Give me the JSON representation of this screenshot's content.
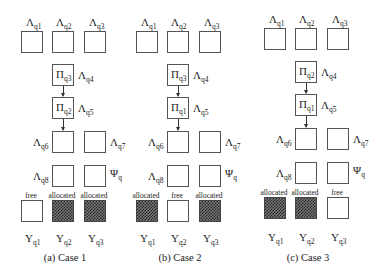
{
  "figure": {
    "cases": [
      {
        "id": "case1",
        "caption": "(a) Case 1",
        "top_labels": [
          {
            "base": "Λ",
            "sub": "q1"
          },
          {
            "base": "Λ",
            "sub": "q2"
          },
          {
            "base": "Λ",
            "sub": "q3"
          }
        ],
        "pi_boxes": [
          {
            "pi": {
              "base": "Π",
              "sub": "q3"
            },
            "lambda": {
              "base": "Λ",
              "sub": "q4"
            }
          },
          {
            "pi": {
              "base": "Π",
              "sub": "q2"
            },
            "lambda": {
              "base": "Λ",
              "sub": "q5"
            }
          }
        ],
        "row6": {
          "left": {
            "base": "Λ",
            "sub": "q6"
          },
          "right": {
            "base": "Λ",
            "sub": "q7"
          }
        },
        "row8": {
          "left": {
            "base": "Λ",
            "sub": "q8"
          },
          "right": {
            "base": "Ψ",
            "sub": "q"
          }
        },
        "slots": [
          {
            "status": "free",
            "label": {
              "base": "Y",
              "sub": "q1"
            }
          },
          {
            "status": "allocated",
            "label": {
              "base": "Y",
              "sub": "q2"
            }
          },
          {
            "status": "allocated",
            "label": {
              "base": "Y",
              "sub": "q3"
            }
          }
        ]
      },
      {
        "id": "case2",
        "caption": "(b) Case 2",
        "top_labels": [
          {
            "base": "Λ",
            "sub": "q1"
          },
          {
            "base": "Λ",
            "sub": "q2"
          },
          {
            "base": "Λ",
            "sub": "q3"
          }
        ],
        "pi_boxes": [
          {
            "pi": {
              "base": "Π",
              "sub": "q3"
            },
            "lambda": {
              "base": "Λ",
              "sub": "q4"
            }
          },
          {
            "pi": {
              "base": "Π",
              "sub": "q1"
            },
            "lambda": {
              "base": "Λ",
              "sub": "q5"
            }
          }
        ],
        "row6": {
          "left": {
            "base": "Λ",
            "sub": "q6"
          },
          "right": {
            "base": "Λ",
            "sub": "q7"
          }
        },
        "row8": {
          "left": {
            "base": "Λ",
            "sub": "q8"
          },
          "right": {
            "base": "Ψ",
            "sub": "q"
          }
        },
        "slots": [
          {
            "status": "allocated",
            "label": {
              "base": "Y",
              "sub": "q1"
            }
          },
          {
            "status": "free",
            "label": {
              "base": "Y",
              "sub": "q2"
            }
          },
          {
            "status": "allocated",
            "label": {
              "base": "Y",
              "sub": "q3"
            }
          }
        ]
      },
      {
        "id": "case3",
        "caption": "(c) Case 3",
        "top_labels": [
          {
            "base": "Λ",
            "sub": "q1"
          },
          {
            "base": "Λ",
            "sub": "q2"
          },
          {
            "base": "Λ",
            "sub": "q3"
          }
        ],
        "pi_boxes": [
          {
            "pi": {
              "base": "Π",
              "sub": "q2"
            },
            "lambda": {
              "base": "Λ",
              "sub": "q4"
            }
          },
          {
            "pi": {
              "base": "Π",
              "sub": "q1"
            },
            "lambda": {
              "base": "Λ",
              "sub": "q5"
            }
          }
        ],
        "row6": {
          "left": {
            "base": "Λ",
            "sub": "q6"
          },
          "right": {
            "base": "Λ",
            "sub": "q7"
          }
        },
        "row8": {
          "left": {
            "base": "Λ",
            "sub": "q8"
          },
          "right": {
            "base": "Ψ",
            "sub": "q"
          }
        },
        "slots": [
          {
            "status": "allocated",
            "label": {
              "base": "Y",
              "sub": "q1"
            }
          },
          {
            "status": "allocated",
            "label": {
              "base": "Y",
              "sub": "q2"
            }
          },
          {
            "status": "free",
            "label": {
              "base": "Y",
              "sub": "q3"
            }
          }
        ]
      }
    ],
    "colors": {
      "box_border": "#555555",
      "allocated_fill": "#333333",
      "background": "#ffffff"
    }
  }
}
